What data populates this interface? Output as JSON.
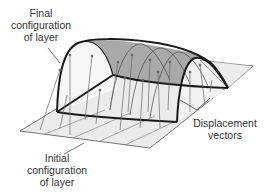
{
  "diagram": {
    "labels": {
      "final": [
        "Final",
        "configuration",
        "of layer"
      ],
      "initial": [
        "Initial",
        "configuration",
        "of layer"
      ],
      "displacement": [
        "Displacement",
        "vectors"
      ]
    },
    "colors": {
      "background": "#ffffff",
      "initial_layer_fill": "#ebebeb",
      "final_layer_fill": "#a9a9a9",
      "final_layer_side": "#f4f4f4",
      "outline": "#1a1a1a",
      "vector": "#6a6a6a",
      "text": "#333333"
    }
  }
}
